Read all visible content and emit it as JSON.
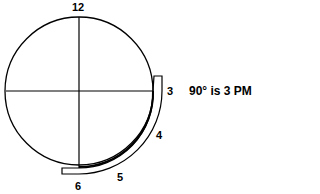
{
  "diagram": {
    "clock_labels": {
      "twelve": "12",
      "three": "3",
      "four": "4",
      "five": "5",
      "six": "6"
    },
    "caption": "90° is 3 PM",
    "colors": {
      "stroke": "#000000",
      "background": "#ffffff"
    }
  }
}
